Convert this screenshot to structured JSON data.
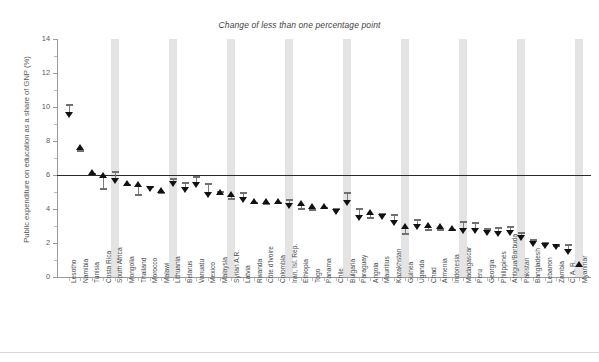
{
  "title": "Change of less than one percentage point",
  "ylabel": "Public expenditure on education as a share of GNP (%)",
  "colors": {
    "band": "#e4e4e4",
    "marker": "#111111",
    "stem": "#7d7d7d",
    "refline": "#2b2b2b",
    "axis": "#9a9a9a",
    "text": "#4a4e51"
  },
  "chart_data": {
    "type": "scatter",
    "title": "Change of less than one percentage point",
    "xlabel": "",
    "ylabel": "Public expenditure on education as a share of GNP (%)",
    "ylim": [
      0,
      14
    ],
    "yticks": [
      0,
      2,
      4,
      6,
      8,
      10,
      12,
      14
    ],
    "ytick_labels": [
      "0",
      "2",
      "4",
      "6",
      "8",
      "10",
      "12",
      "14"
    ],
    "grid": false,
    "legend": null,
    "reference_line": 6,
    "band_every": 5,
    "marker_note": "horizontal tick = start value, triangle = end value (up = increase, down = decrease)",
    "categories": [
      "Lesotho",
      "Namibia",
      "Tunisia",
      "Costa Rica",
      "South Africa",
      "Mongolia",
      "Thailand",
      "Morocco",
      "Malawi",
      "Lithuania",
      "Belarus",
      "Vanuatu",
      "Mexico",
      "Malaysia",
      "Syrian A.R.",
      "Latvia",
      "Rwanda",
      "Côte d'Ivoire",
      "Colombia",
      "Iran, Isl. Rep.",
      "Ethiopia",
      "Togo",
      "Panama",
      "Chile",
      "Bulgaria",
      "Paraguay",
      "Angola",
      "Mauritius",
      "Kazakhstan",
      "Guinea",
      "Uganda",
      "Chad",
      "Armenia",
      "Indonesia",
      "Madagascar",
      "Peru",
      "Georgia",
      "Philippines",
      "Antigua/Barbuda",
      "Pakistan",
      "Bangladesh",
      "Lebanon",
      "Zambia",
      "C. A. R.",
      "Myanmar"
    ],
    "series": [
      {
        "name": "Start value",
        "values": [
          10.1,
          7.4,
          6.05,
          5.2,
          6.15,
          5.4,
          4.85,
          5.3,
          4.95,
          5.75,
          5.55,
          5.9,
          5.45,
          5.0,
          4.6,
          4.95,
          4.35,
          4.3,
          4.35,
          4.55,
          4.0,
          3.95,
          4.05,
          4.0,
          4.95,
          4.0,
          3.5,
          3.7,
          3.65,
          2.55,
          3.35,
          2.75,
          2.75,
          2.75,
          3.25,
          3.2,
          2.8,
          2.9,
          2.95,
          2.6,
          2.2,
          2.0,
          1.85,
          1.9,
          0.0
        ]
      },
      {
        "name": "End value",
        "values": [
          9.55,
          7.65,
          6.15,
          6.0,
          5.65,
          5.55,
          5.5,
          5.2,
          5.1,
          5.45,
          5.1,
          5.4,
          4.85,
          5.0,
          4.9,
          4.55,
          4.5,
          4.45,
          4.45,
          4.2,
          4.35,
          4.2,
          4.15,
          3.85,
          4.35,
          3.5,
          3.8,
          3.55,
          3.2,
          3.0,
          2.95,
          3.05,
          3.0,
          2.9,
          2.7,
          2.7,
          2.6,
          2.55,
          2.6,
          2.3,
          1.95,
          1.85,
          1.75,
          1.5,
          0.75
        ]
      }
    ],
    "directions": [
      "down",
      "up",
      "up",
      "up",
      "down",
      "up",
      "up",
      "down",
      "up",
      "down",
      "down",
      "down",
      "down",
      "up",
      "up",
      "down",
      "up",
      "up",
      "up",
      "down",
      "up",
      "up",
      "up",
      "down",
      "down",
      "down",
      "up",
      "down",
      "down",
      "up",
      "down",
      "up",
      "up",
      "up",
      "down",
      "down",
      "down",
      "down",
      "down",
      "down",
      "down",
      "down",
      "down",
      "down",
      "up"
    ]
  }
}
